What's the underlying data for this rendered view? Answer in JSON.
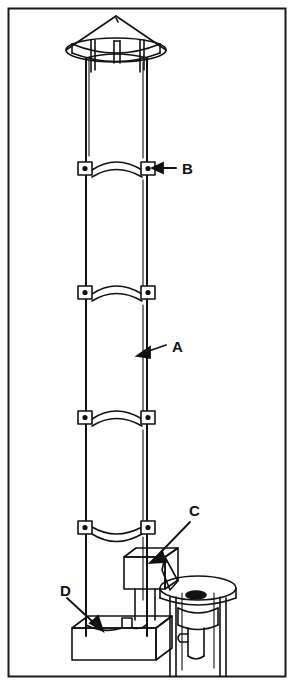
{
  "figure": {
    "kind": "line-art technical illustration",
    "border_color": "#1a1a1a",
    "line_color": "#111111",
    "background_color": "#ffffff",
    "frame": {
      "x": 8,
      "y": 8,
      "width": 277,
      "height": 668
    }
  },
  "callouts": [
    {
      "id": "B",
      "label": "B",
      "text_x": 182,
      "text_y": 174,
      "refers_to": "band-clamp",
      "leader": {
        "x1": 176,
        "y1": 168,
        "x2": 152,
        "y2": 168
      }
    },
    {
      "id": "A",
      "label": "A",
      "text_x": 172,
      "text_y": 352,
      "refers_to": "column-section",
      "leader": {
        "x1": 166,
        "y1": 346,
        "x2": 138,
        "y2": 355
      }
    },
    {
      "id": "C",
      "label": "C",
      "text_x": 189,
      "text_y": 516,
      "refers_to": "discharge-chute",
      "leader": {
        "x1": 188,
        "y1": 522,
        "x2": 152,
        "y2": 558
      }
    },
    {
      "id": "D",
      "label": "D",
      "text_x": 60,
      "text_y": 596,
      "refers_to": "base-pedestal",
      "leader": {
        "x1": 66,
        "y1": 600,
        "x2": 99,
        "y2": 628
      }
    }
  ],
  "parts": {
    "rain_cap": {
      "name": "conical rain cap",
      "post_count": 3,
      "apex": {
        "x": 116,
        "y": 16
      }
    },
    "column": {
      "name": "vertical cylindrical column",
      "left_edge_x": 85,
      "right_edge_x": 148,
      "top_y": 52,
      "bottom_y": 636,
      "seam_line_x": 143
    },
    "band_clamps": {
      "name": "band clamp",
      "count": 4,
      "y_positions": [
        168,
        292,
        417,
        525
      ],
      "tab_dot": true
    },
    "chute": {
      "name": "discharge chute and collection box",
      "box": {
        "x": 124,
        "y": 549,
        "width": 44,
        "height": 36
      }
    },
    "base": {
      "name": "base pedestal block",
      "x": 70,
      "y": 620,
      "width": 85,
      "height": 40
    },
    "receiver_table": {
      "name": "circular receiver table with valve",
      "center_x": 198,
      "ellipse_y": 590,
      "rx": 38,
      "ry": 12,
      "leg_count": 4
    }
  }
}
